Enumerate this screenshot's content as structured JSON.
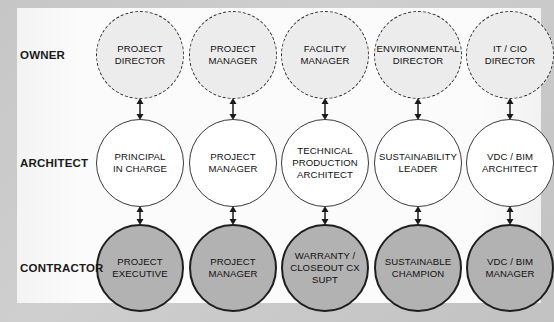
{
  "diagram": {
    "background_color": "#c9c9c9",
    "panel_color": "#fbfbfb",
    "rows": [
      {
        "id": "owner",
        "label": "OWNER",
        "style": "dashed",
        "fill_color": "#ececec",
        "border_color": "#2a2a2a"
      },
      {
        "id": "architect",
        "label": "ARCHITECT",
        "style": "solid-thin",
        "fill_color": "#ffffff",
        "border_color": "#3a3a3a"
      },
      {
        "id": "contractor",
        "label": "CONTRACTOR",
        "style": "solid-thick",
        "fill_color": "#b2b2b2",
        "border_color": "#1f1f1f"
      }
    ],
    "nodes": {
      "owner": [
        "PROJECT\nDIRECTOR",
        "PROJECT\nMANAGER",
        "FACILITY\nMANAGER",
        "ENVIRONMENTAL\nDIRECTOR",
        "IT / CIO\nDIRECTOR"
      ],
      "architect": [
        "PRINCIPAL\nIN CHARGE",
        "PROJECT\nMANAGER",
        "TECHNICAL\nPRODUCTION\nARCHITECT",
        "SUSTAINABILITY\nLEADER",
        "VDC / BIM\nARCHITECT"
      ],
      "contractor": [
        "PROJECT\nEXECUTIVE",
        "PROJECT\nMANAGER",
        "WARRANTY /\nCLOSEOUT CX\nSUPT",
        "SUSTAINABLE\nCHAMPION",
        "VDC / BIM\nMANAGER"
      ]
    },
    "connectors": {
      "type": "double-headed-arrow",
      "color": "#1a1a1a",
      "pairs": [
        "owner-architect",
        "architect-contractor"
      ],
      "count_per_pair": 5
    }
  }
}
